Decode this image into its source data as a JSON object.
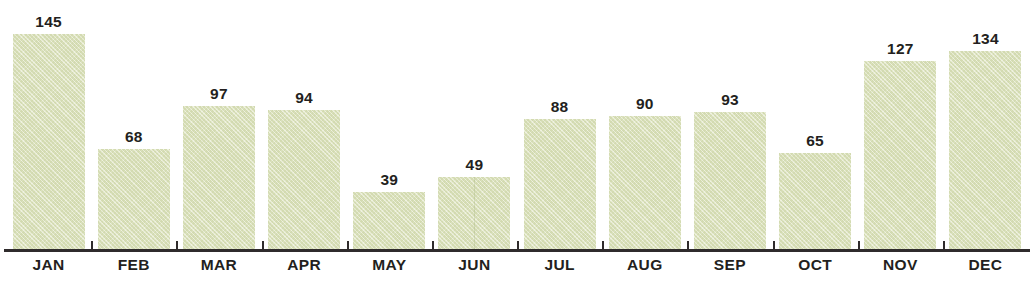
{
  "clipped_title": "",
  "clipped_caption": "",
  "colors": {
    "bar_fill": "#dde3bd",
    "bar_texture": "#c4ce9e",
    "axis": "#2f2b2c",
    "text": "#231f20",
    "background": "#ffffff"
  },
  "chart_data": {
    "type": "bar",
    "title": "",
    "subtitle": "",
    "xlabel": "",
    "ylabel": "",
    "ylim": [
      0,
      160
    ],
    "grid": false,
    "legend": "none",
    "value_labels": true,
    "categories": [
      "JAN",
      "FEB",
      "MAR",
      "APR",
      "MAY",
      "JUN",
      "JUL",
      "AUG",
      "SEP",
      "OCT",
      "NOV",
      "DEC"
    ],
    "values": [
      145,
      68,
      97,
      94,
      39,
      49,
      88,
      90,
      93,
      65,
      127,
      134
    ],
    "series": [
      {
        "name": "",
        "values": [
          145,
          68,
          97,
          94,
          39,
          49,
          88,
          90,
          93,
          65,
          127,
          134
        ]
      }
    ],
    "points": [
      {
        "category": "JAN",
        "value": 145
      },
      {
        "category": "FEB",
        "value": 68
      },
      {
        "category": "MAR",
        "value": 97
      },
      {
        "category": "APR",
        "value": 94
      },
      {
        "category": "MAY",
        "value": 39
      },
      {
        "category": "JUN",
        "value": 49
      },
      {
        "category": "JUL",
        "value": 88
      },
      {
        "category": "AUG",
        "value": 90
      },
      {
        "category": "SEP",
        "value": 93
      },
      {
        "category": "OCT",
        "value": 65
      },
      {
        "category": "NOV",
        "value": 127
      },
      {
        "category": "DEC",
        "value": 134
      }
    ]
  }
}
